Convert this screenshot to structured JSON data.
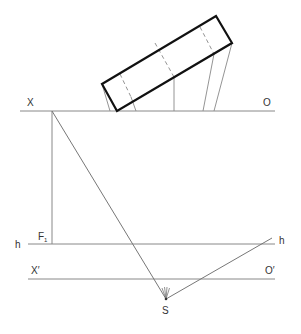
{
  "diagram": {
    "labels": {
      "x": "X",
      "o": "O",
      "f1_main": "F",
      "f1_sub": "1",
      "h_left": "h",
      "h_right": "h",
      "x_prime": "X′",
      "o_prime": "O′",
      "s": "S"
    },
    "colors": {
      "line": "#777777",
      "outline": "#111111",
      "background": "#ffffff"
    }
  }
}
